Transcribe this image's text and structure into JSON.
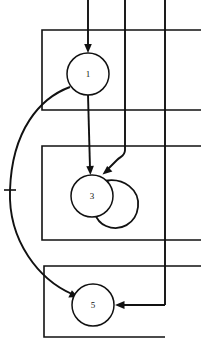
{
  "figure": {
    "type": "state-transition-diagram",
    "background_color": "#ffffff",
    "line_color": "#111111",
    "width": 201,
    "height": 348,
    "nodes": [
      {
        "id": "node-1",
        "label": "1",
        "cx": 88,
        "cy": 74,
        "r": 21
      },
      {
        "id": "node-3",
        "label": "3",
        "cx": 92,
        "cy": 196,
        "r": 21
      },
      {
        "id": "node-5",
        "label": "5",
        "cx": 93,
        "cy": 305,
        "r": 21
      }
    ],
    "self_loops": [
      {
        "id": "loop-node-3",
        "on": "node-3",
        "cx": 119,
        "cy": 206,
        "r": 20
      }
    ],
    "boxes": [
      {
        "id": "box-top",
        "x": 42,
        "y": 30,
        "w": 159,
        "h": 80,
        "open_side": "right"
      },
      {
        "id": "box-middle",
        "x": 42,
        "y": 146,
        "w": 159,
        "h": 94,
        "open_side": "right"
      },
      {
        "id": "box-bottom",
        "x": 44,
        "y": 266,
        "w": 121,
        "h": 71,
        "open_side": "none"
      }
    ],
    "vertical_lines": [
      {
        "id": "vline-entry",
        "x": 88,
        "y_start": 0,
        "y_end": 53
      },
      {
        "id": "vline-mid",
        "x": 125,
        "y_start": 0,
        "y_end": 152
      },
      {
        "id": "vline-right",
        "x": 165,
        "y_start": 0,
        "y_end": 305
      }
    ],
    "tick_marks": [
      {
        "id": "tick-left-curve",
        "x": 10,
        "y": 190,
        "length": 11
      }
    ],
    "edges": [
      {
        "id": "edge-entry-to-1",
        "from": "top-boundary",
        "to": "node-1",
        "arrow": true
      },
      {
        "id": "edge-1-to-3",
        "from": "node-1",
        "to": "node-3",
        "arrow": true
      },
      {
        "id": "edge-mid-to-3",
        "from": "vline-mid",
        "to": "node-3",
        "arrow": true
      },
      {
        "id": "edge-3-self-loop",
        "from": "node-3",
        "to": "node-3",
        "arrow": true
      },
      {
        "id": "edge-1-to-5-curve",
        "from": "node-1",
        "to": "node-5",
        "arrow": true
      },
      {
        "id": "edge-right-to-5",
        "from": "vline-right",
        "to": "node-5",
        "arrow": true
      }
    ]
  }
}
